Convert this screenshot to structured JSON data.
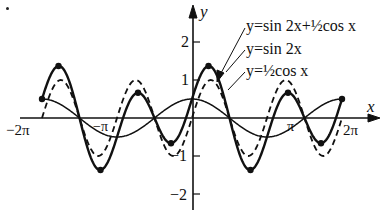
{
  "chart_data": {
    "type": "line",
    "title": "",
    "xlabel": "x",
    "ylabel": "y",
    "xlim": [
      -6.2832,
      6.2832
    ],
    "ylim": [
      -2.2,
      2.4
    ],
    "x_ticks": [
      {
        "value": -6.2832,
        "label": "−2π"
      },
      {
        "value": -3.1416,
        "label": "−π"
      },
      {
        "value": 3.1416,
        "label": "π"
      },
      {
        "value": 6.2832,
        "label": "2π"
      }
    ],
    "y_ticks": [
      {
        "value": 2,
        "label": "2"
      },
      {
        "value": 1,
        "label": "1"
      },
      {
        "value": -1,
        "label": "−1"
      },
      {
        "value": -2,
        "label": "−2"
      }
    ],
    "grid": false,
    "series": [
      {
        "name": "y=sin 2x+½cos x",
        "expr": "sin(2x)+0.5cos(x)",
        "style": "solid-thick",
        "marked_points": true
      },
      {
        "name": "y=sin 2x",
        "expr": "sin(2x)",
        "style": "dashed"
      },
      {
        "name": "y=½cos x",
        "expr": "0.5cos(x)",
        "style": "solid-thin"
      }
    ],
    "legend_position": "top-right, with leader arrows"
  },
  "labels": {
    "y_axis": "y",
    "x_axis": "x",
    "neg_two_pi": "−2π",
    "neg_pi": "−π",
    "pi": "π",
    "two_pi": "2π",
    "y2": "2",
    "y1": "1",
    "ym1": "−1",
    "ym2": "−2",
    "legend_sum": "y=sin 2x+½cos x",
    "legend_sin": "y=sin 2x",
    "legend_cos": "y=½cos x"
  }
}
